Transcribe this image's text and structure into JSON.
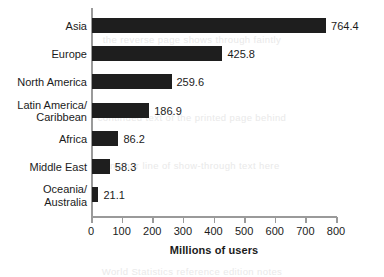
{
  "chart_data": {
    "type": "bar",
    "orientation": "horizontal",
    "title": "",
    "xlabel": "Millions of users",
    "ylabel": "",
    "xlim": [
      0,
      800
    ],
    "grid": false,
    "legend": null,
    "categories": [
      "Asia",
      "Europe",
      "North America",
      "Latin America/\nCaribbean",
      "Africa",
      "Middle East",
      "Oceania/\nAustralia"
    ],
    "values": [
      764.4,
      425.8,
      259.6,
      186.9,
      86.2,
      58.3,
      21.1
    ],
    "value_labels": [
      "764.4",
      "425.8",
      "259.6",
      "186.9",
      "86.2",
      "58.3",
      "21.1"
    ],
    "x_ticks": [
      0,
      100,
      200,
      300,
      400,
      500,
      600,
      700,
      800
    ],
    "x_tick_labels": [
      "0",
      "100",
      "200",
      "300",
      "400",
      "500",
      "600",
      "700",
      "800"
    ],
    "bar_color": "#1e1e1e",
    "axis_color": "#9a9a9a",
    "text_color": "#1b1b1b"
  },
  "bleed_text": [
    "the reverse page shows through faintly",
    "continued text of the printed page behind",
    "another line of show-through text here",
    "World Statistics reference edition notes"
  ]
}
